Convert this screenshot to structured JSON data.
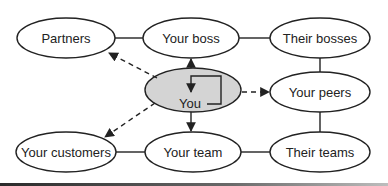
{
  "diagram": {
    "nodes": [
      {
        "id": "partners",
        "label": "Partners",
        "cx": 66,
        "cy": 38,
        "rx": 49,
        "ry": 20,
        "fill": "#ffffff"
      },
      {
        "id": "boss",
        "label": "Your boss",
        "cx": 191,
        "cy": 38,
        "rx": 48,
        "ry": 20,
        "fill": "#ffffff"
      },
      {
        "id": "their-bosses",
        "label": "Their bosses",
        "cx": 320,
        "cy": 38,
        "rx": 50,
        "ry": 20,
        "fill": "#ffffff"
      },
      {
        "id": "you",
        "label": "You",
        "cx": 193,
        "cy": 90,
        "rx": 48,
        "ry": 22,
        "fill": "#d4d4d4"
      },
      {
        "id": "peers",
        "label": "Your peers",
        "cx": 320,
        "cy": 92,
        "rx": 50,
        "ry": 20,
        "fill": "#ffffff"
      },
      {
        "id": "customers",
        "label": "Your customers",
        "cx": 66,
        "cy": 152,
        "rx": 50,
        "ry": 20,
        "fill": "#ffffff"
      },
      {
        "id": "team",
        "label": "Your team",
        "cx": 193,
        "cy": 152,
        "rx": 48,
        "ry": 20,
        "fill": "#ffffff"
      },
      {
        "id": "their-teams",
        "label": "Their teams",
        "cx": 320,
        "cy": 152,
        "rx": 50,
        "ry": 20,
        "fill": "#ffffff"
      }
    ],
    "edges": [
      {
        "from": "partners",
        "to": "boss",
        "style": "solid"
      },
      {
        "from": "boss",
        "to": "their-bosses",
        "style": "solid"
      },
      {
        "from": "their-bosses",
        "to": "peers",
        "style": "solid"
      },
      {
        "from": "peers",
        "to": "their-teams",
        "style": "solid"
      },
      {
        "from": "customers",
        "to": "team",
        "style": "solid"
      },
      {
        "from": "team",
        "to": "their-teams",
        "style": "solid"
      },
      {
        "from": "you",
        "to": "boss",
        "style": "solid-arrow"
      },
      {
        "from": "you",
        "to": "team",
        "style": "solid-arrow"
      },
      {
        "from": "you",
        "to": "you",
        "style": "self-loop-arrow"
      },
      {
        "from": "you",
        "to": "partners",
        "style": "dashed-arrow"
      },
      {
        "from": "you",
        "to": "customers",
        "style": "dashed-arrow"
      },
      {
        "from": "you",
        "to": "peers",
        "style": "dashed-arrow"
      }
    ],
    "colors": {
      "stroke": "#222222",
      "you_fill": "#d4d4d4",
      "background": "#ffffff"
    }
  }
}
